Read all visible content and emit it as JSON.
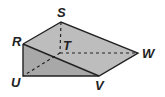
{
  "figure": {
    "type": "triangular prism",
    "vertices": {
      "S": {
        "x": 61,
        "y": 22,
        "label": "S"
      },
      "R": {
        "x": 23,
        "y": 44,
        "label": "R"
      },
      "T": {
        "x": 60,
        "y": 53,
        "label": "T"
      },
      "W": {
        "x": 138,
        "y": 53,
        "label": "W"
      },
      "U": {
        "x": 23,
        "y": 76,
        "label": "U"
      },
      "V": {
        "x": 99,
        "y": 76,
        "label": "V"
      }
    },
    "hidden_edges": [
      "ST",
      "TU",
      "TW"
    ],
    "colors": {
      "top_face": "#c4c4c4",
      "front_face": "#9a9a9a",
      "side_face": "#b4b4b4",
      "edge": "#222222"
    }
  }
}
